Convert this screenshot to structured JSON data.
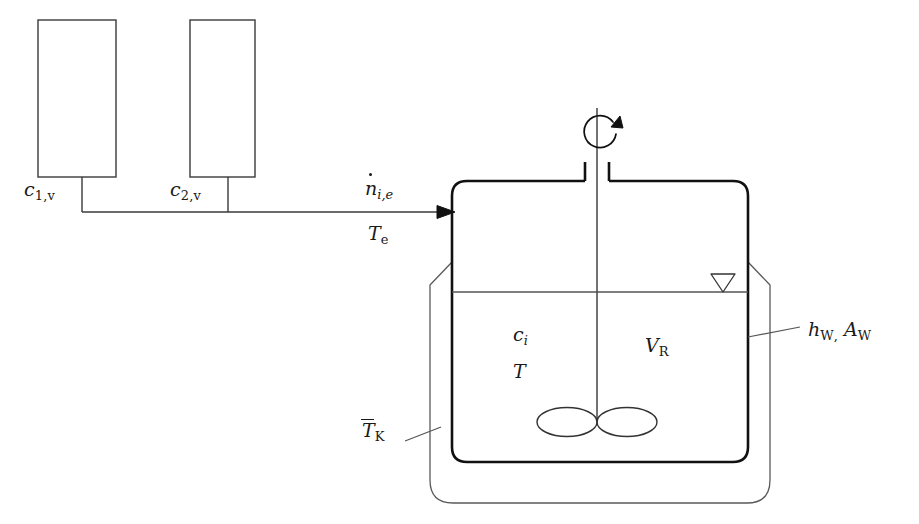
{
  "diagram": {
    "type": "process-flow-schematic",
    "background_color": "#ffffff",
    "line_color": "#333333",
    "vessel_line_color": "#111111",
    "text_color": "#1a1a1a"
  },
  "feed_tanks": [
    {
      "id": "tank-1",
      "label_base": "c",
      "label_sub": "1,v",
      "label_plain": "c_{1,v}",
      "x": 38,
      "y": 20,
      "width": 78,
      "height": 157
    },
    {
      "id": "tank-2",
      "label_base": "c",
      "label_sub": "2,v",
      "label_plain": "c_{2,v}",
      "x": 190,
      "y": 20,
      "width": 65,
      "height": 157
    }
  ],
  "inlet_stream": {
    "flow_label_base": "n",
    "flow_label_sub": "i,e",
    "flow_label_plain": "ndot_{i,e}",
    "temperature_label_base": "T",
    "temperature_label_sub": "e",
    "temperature_label_plain": "T_e",
    "arrow_tip_x": 455,
    "arrow_tip_y": 212
  },
  "reactor": {
    "contents_labels": [
      {
        "id": "concentration",
        "base": "c",
        "sub": "i",
        "sub_italic": true,
        "plain": "c_i"
      },
      {
        "id": "temperature",
        "base": "T",
        "sub": "",
        "plain": "T"
      },
      {
        "id": "volume",
        "base": "V",
        "sub": "R",
        "plain": "V_R"
      }
    ],
    "vessel": {
      "x": 452,
      "y": 180,
      "width": 296,
      "height": 282
    },
    "liquid_level_y": 292,
    "level_indicator": "level-triangle",
    "stirrer": {
      "shaft_x": 597,
      "shaft_top_y": 105,
      "shaft_bottom_y": 422,
      "rotation_icon": "rotation-arrow",
      "impeller": "twin-ellipse-blades"
    }
  },
  "jacket": {
    "label_base": "T",
    "label_sub": "K",
    "label_plain": "Tbar_K",
    "label_overline": true,
    "leader_from_x": 405,
    "leader_to_x": 440
  },
  "wall_transfer": {
    "label_plain": "h_W, A_W",
    "h_base": "h",
    "h_sub": "W",
    "separator": ",",
    "a_base": "A",
    "a_sub": "W",
    "leader_from_x": 748,
    "leader_to_x": 800
  }
}
